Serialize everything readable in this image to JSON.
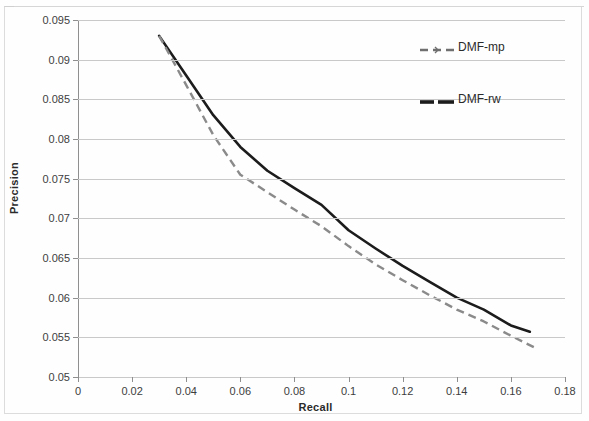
{
  "chart_data": {
    "type": "line",
    "title": "",
    "xlabel": "Recall",
    "ylabel": "Precision",
    "xlim": [
      0,
      0.18
    ],
    "ylim": [
      0.05,
      0.095
    ],
    "xticks": [
      "0",
      "0.02",
      "0.04",
      "0.06",
      "0.08",
      "0.1",
      "0.12",
      "0.14",
      "0.16",
      "0.18"
    ],
    "xtick_values": [
      0,
      0.02,
      0.04,
      0.06,
      0.08,
      0.1,
      0.12,
      0.14,
      0.16,
      0.18
    ],
    "yticks": [
      "0.05",
      "0.055",
      "0.06",
      "0.065",
      "0.07",
      "0.075",
      "0.08",
      "0.085",
      "0.09",
      "0.095"
    ],
    "ytick_values": [
      0.05,
      0.055,
      0.06,
      0.065,
      0.07,
      0.075,
      0.08,
      0.085,
      0.09,
      0.095
    ],
    "grid": "horizontal",
    "legend_position": "upper-right",
    "series": [
      {
        "name": "DMF-mp",
        "style": "dashed",
        "color": "#8a8a8a",
        "x": [
          0.03,
          0.04,
          0.05,
          0.06,
          0.07,
          0.08,
          0.09,
          0.1,
          0.11,
          0.12,
          0.13,
          0.14,
          0.15,
          0.16,
          0.17
        ],
        "y": [
          0.093,
          0.0868,
          0.0805,
          0.0755,
          0.0733,
          0.0711,
          0.069,
          0.0665,
          0.0642,
          0.0622,
          0.0603,
          0.0585,
          0.057,
          0.0552,
          0.0535
        ]
      },
      {
        "name": "DMF-rw",
        "style": "solid",
        "color": "#1c1c1c",
        "x": [
          0.03,
          0.04,
          0.05,
          0.06,
          0.07,
          0.08,
          0.09,
          0.1,
          0.11,
          0.12,
          0.13,
          0.14,
          0.15,
          0.16,
          0.167
        ],
        "y": [
          0.093,
          0.088,
          0.083,
          0.079,
          0.076,
          0.0738,
          0.0717,
          0.0685,
          0.0662,
          0.064,
          0.062,
          0.06,
          0.0585,
          0.0565,
          0.0557
        ]
      }
    ]
  },
  "legend": {
    "items": [
      {
        "label": "DMF-mp",
        "style": "dashed"
      },
      {
        "label": "DMF-rw",
        "style": "solid"
      }
    ]
  }
}
